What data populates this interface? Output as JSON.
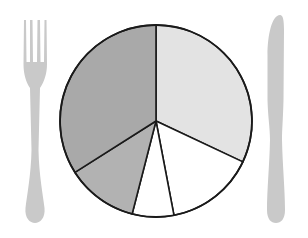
{
  "chart_data": {
    "type": "pie",
    "title": "",
    "style": "plate with fork and knife",
    "legend": "none",
    "start_angle_deg": 0,
    "direction": "clockwise",
    "labels": [
      "Slice A",
      "Slice B",
      "Slice C",
      "Slice D",
      "Slice E"
    ],
    "values": [
      32,
      15,
      7,
      12,
      34
    ],
    "colors": [
      "#e3e3e3",
      "#ffffff",
      "#ffffff",
      "#b2b2b2",
      "#a9a9a9"
    ]
  },
  "scene": {
    "background": "#ffffff",
    "plate": {
      "cx": 156,
      "cy": 121,
      "r": 96,
      "outline": "#1a1a1a"
    },
    "fork": {
      "color": "#c9c9c9",
      "side": "left"
    },
    "knife": {
      "color": "#c9c9c9",
      "side": "right"
    }
  },
  "a11y": {
    "description": "Pie chart drawn as a dinner plate between a fork and a knife"
  }
}
